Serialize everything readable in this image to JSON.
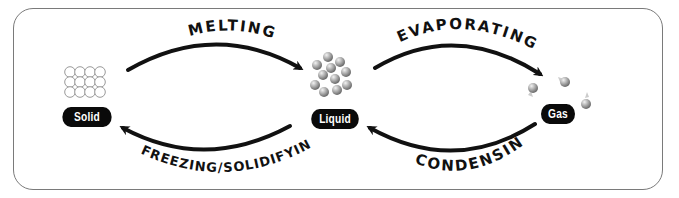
{
  "diagram": {
    "states": [
      {
        "id": "solid",
        "label": "Solid",
        "particles": "regular-lattice"
      },
      {
        "id": "liquid",
        "label": "Liquid",
        "particles": "loosely-packed-cluster"
      },
      {
        "id": "gas",
        "label": "Gas",
        "particles": "spread-apart"
      }
    ],
    "processes": [
      {
        "id": "melting",
        "label": "MELTING",
        "from": "Solid",
        "to": "Liquid"
      },
      {
        "id": "evaporating",
        "label": "EVAPORATING",
        "from": "Liquid",
        "to": "Gas"
      },
      {
        "id": "condensing",
        "label": "CONDENSING",
        "from": "Gas",
        "to": "Liquid"
      },
      {
        "id": "freezing",
        "label": "FREEZING/SOLIDIFYING",
        "from": "Liquid",
        "to": "Solid"
      }
    ],
    "colors": {
      "pill_background": "#0a0a0a",
      "pill_text": "#ffffff",
      "arrow": "#111111",
      "frame": "#7a7a7a",
      "particle": "#9a9a9a"
    }
  }
}
